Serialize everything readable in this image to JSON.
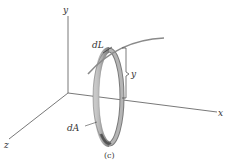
{
  "figure": {
    "caption": "(c)",
    "axes": {
      "x_label": "x",
      "y_label": "y",
      "z_label": "z"
    },
    "labels": {
      "arc_element": "dL",
      "area_element": "dA",
      "height": "y"
    },
    "colors": {
      "axis": "#555555",
      "curve": "#8a8a8a",
      "ring_fill": "#a9a9a9",
      "ring_dark": "#7a7a7a",
      "ring_light": "#c8c8c8",
      "text": "#333333"
    }
  }
}
